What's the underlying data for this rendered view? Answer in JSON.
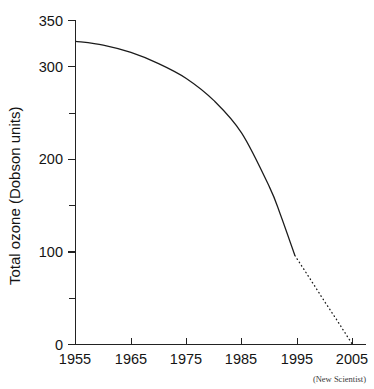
{
  "chart_data": {
    "type": "line",
    "title": "",
    "subtitle": "",
    "xlabel": "",
    "ylabel": "Total ozone (Dobson units)",
    "source": "(New Scientist)",
    "grid": false,
    "legend": false,
    "xlim": [
      1955,
      2005
    ],
    "ylim": [
      0,
      350
    ],
    "x_ticks": [
      1955,
      1965,
      1975,
      1985,
      1995,
      2005
    ],
    "x_tick_labels": [
      "1955",
      "1965",
      "1975",
      "1985",
      "1995",
      "2005"
    ],
    "y_ticks": [
      0,
      100,
      200,
      300,
      350
    ],
    "y_tick_labels": [
      "0",
      "100",
      "200",
      "300",
      "350"
    ],
    "y_minor_ticks": [
      50,
      150,
      250
    ],
    "series": [
      {
        "name": "Total ozone (observed)",
        "style": "solid",
        "x": [
          1955,
          1960,
          1965,
          1970,
          1975,
          1980,
          1985,
          1990,
          1992,
          1994.6
        ],
        "values": [
          327,
          323,
          315,
          303,
          287,
          263,
          228,
          170,
          140,
          96
        ]
      },
      {
        "name": "Total ozone (projected)",
        "style": "dotted",
        "x": [
          1994.6,
          1997,
          2000,
          2002,
          2005
        ],
        "values": [
          96,
          74,
          46,
          28,
          0
        ]
      }
    ]
  },
  "axes": {
    "y_title": "Total ozone (Dobson units)",
    "x_title": ""
  },
  "attribution": {
    "text": "(New Scientist)"
  }
}
